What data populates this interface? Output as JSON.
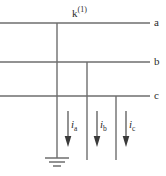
{
  "diagram": {
    "title": "k(1)",
    "fault_label": {
      "base": "k",
      "superscript": "(1)"
    },
    "phase_labels": [
      {
        "name": "a",
        "text": "a",
        "y": 23
      },
      {
        "name": "b",
        "text": "b",
        "y": 62
      },
      {
        "name": "c",
        "text": "c",
        "y": 96
      }
    ],
    "current_labels": [
      {
        "name": "ia",
        "symbol": "i",
        "subscript": "a"
      },
      {
        "name": "ib",
        "symbol": "i",
        "subscript": "b"
      },
      {
        "name": "ic",
        "symbol": "i",
        "subscript": "c"
      }
    ],
    "ground_symbol": "earth-ground",
    "colors": {
      "line": "#6e6e6e",
      "text": "#2b2b2b",
      "arrow": "#3a3a3a",
      "background": "#ffffff"
    }
  }
}
